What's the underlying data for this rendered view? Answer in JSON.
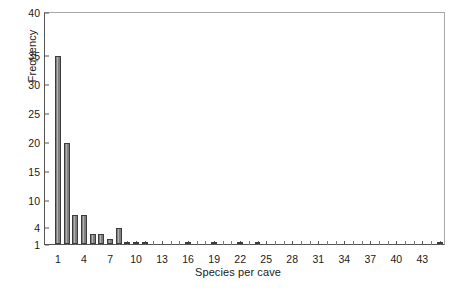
{
  "chart_data": {
    "type": "bar",
    "title": "",
    "subtitle": "",
    "xlabel": "Species per cave",
    "ylabel": "Frequency",
    "grid": false,
    "legend": null,
    "xlim": [
      0,
      46
    ],
    "ylim": [
      1,
      40
    ],
    "y_tick_labels": [
      "1",
      "4",
      "10",
      "15",
      "20",
      "25",
      "30",
      "35",
      "40"
    ],
    "y_tick_values": [
      1,
      4,
      10,
      15,
      20,
      25,
      30,
      35,
      40
    ],
    "x_tick_labels": [
      "1",
      "4",
      "7",
      "10",
      "13",
      "16",
      "19",
      "22",
      "25",
      "28",
      "31",
      "34",
      "37",
      "40",
      "43"
    ],
    "x_tick_values": [
      1,
      4,
      7,
      10,
      13,
      16,
      19,
      22,
      25,
      28,
      31,
      34,
      37,
      40,
      43
    ],
    "x_minor_ticks": [
      2,
      3,
      5,
      6,
      8,
      9,
      11,
      12,
      14,
      15,
      17,
      18,
      20,
      21,
      23,
      24,
      26,
      27,
      29,
      30,
      32,
      33,
      35,
      36,
      38,
      39,
      41,
      42,
      44,
      45
    ],
    "bar_color": "#808080",
    "bar_edge_color": "#3c3c3c",
    "frame_color": "#a8a8a8",
    "axis_color": "#555555",
    "text_color": "#1a1a1a",
    "categories": [
      1,
      2,
      3,
      4,
      5,
      6,
      7,
      8,
      9,
      10,
      11,
      16,
      19,
      22,
      24,
      45
    ],
    "values": [
      35,
      20,
      7,
      7,
      3,
      3,
      2,
      4,
      1,
      1,
      1,
      1,
      1,
      1,
      1,
      1
    ],
    "bars": [
      {
        "x": 1,
        "y": 35
      },
      {
        "x": 2,
        "y": 20
      },
      {
        "x": 3,
        "y": 7
      },
      {
        "x": 4,
        "y": 7
      },
      {
        "x": 5,
        "y": 3
      },
      {
        "x": 6,
        "y": 3
      },
      {
        "x": 7,
        "y": 2
      },
      {
        "x": 8,
        "y": 4
      },
      {
        "x": 9,
        "y": 1
      },
      {
        "x": 10,
        "y": 1
      },
      {
        "x": 11,
        "y": 1
      },
      {
        "x": 16,
        "y": 1
      },
      {
        "x": 19,
        "y": 1
      },
      {
        "x": 22,
        "y": 1
      },
      {
        "x": 24,
        "y": 1
      },
      {
        "x": 45,
        "y": 1
      }
    ]
  }
}
